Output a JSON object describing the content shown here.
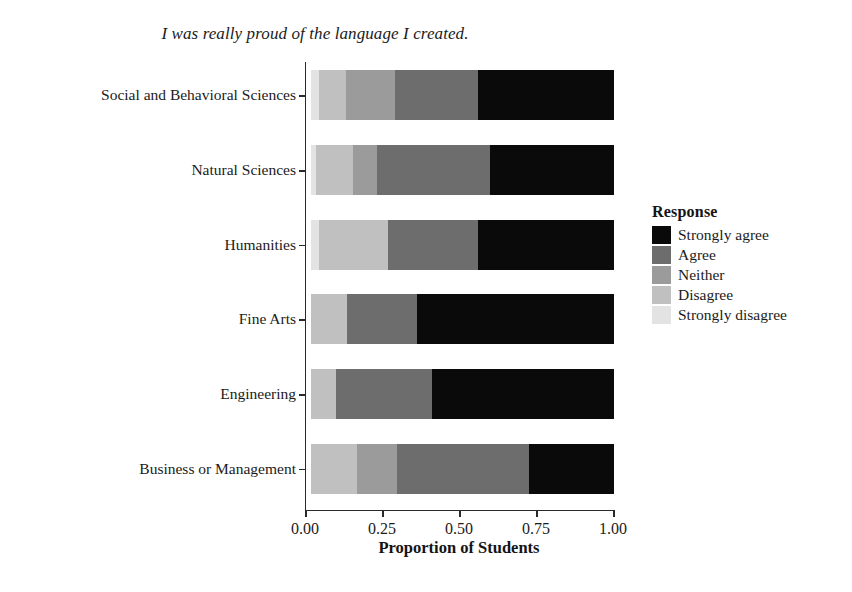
{
  "chart_data": {
    "type": "bar",
    "subtype": "stacked-horizontal-100pct",
    "title": "I was really proud of the language I created.",
    "xlabel": "Proportion of Students",
    "ylabel": "",
    "xlim": [
      0,
      1
    ],
    "xticks": [
      0.0,
      0.25,
      0.5,
      0.75,
      1.0
    ],
    "xticklabels": [
      "0.00",
      "0.25",
      "0.50",
      "0.75",
      "1.00"
    ],
    "grid": false,
    "legend_title": "Response",
    "legend_position": "right",
    "categories": [
      "Social and Behavioral Sciences",
      "Natural Sciences",
      "Humanities",
      "Fine Arts",
      "Engineering",
      "Business or Management"
    ],
    "series": [
      {
        "name": "Strongly disagree",
        "color": "#e3e3e3",
        "values": [
          0.026,
          0.016,
          0.026,
          0.0,
          0.0,
          0.0
        ]
      },
      {
        "name": "Disagree",
        "color": "#c0c0c0",
        "values": [
          0.088,
          0.124,
          0.227,
          0.12,
          0.081,
          0.152
        ]
      },
      {
        "name": "Neither",
        "color": "#9b9b9b",
        "values": [
          0.162,
          0.078,
          0.0,
          0.0,
          0.0,
          0.133
        ]
      },
      {
        "name": "Agree",
        "color": "#6d6d6d",
        "values": [
          0.276,
          0.372,
          0.299,
          0.23,
          0.319,
          0.435
        ]
      },
      {
        "name": "Strongly agree",
        "color": "#0a0a0a",
        "values": [
          0.448,
          0.41,
          0.448,
          0.65,
          0.6,
          0.28
        ]
      }
    ],
    "stack_order": [
      "Strongly disagree",
      "Disagree",
      "Neither",
      "Agree",
      "Strongly agree"
    ],
    "legend_order": [
      "Strongly agree",
      "Agree",
      "Neither",
      "Disagree",
      "Strongly disagree"
    ]
  },
  "legend": {
    "title": "Response",
    "items": [
      {
        "label": "Strongly agree",
        "color": "#0a0a0a"
      },
      {
        "label": "Agree",
        "color": "#6d6d6d"
      },
      {
        "label": "Neither",
        "color": "#9b9b9b"
      },
      {
        "label": "Disagree",
        "color": "#c0c0c0"
      },
      {
        "label": "Strongly disagree",
        "color": "#e3e3e3"
      }
    ]
  },
  "axes": {
    "x_title": "Proportion of Students",
    "x_tick_labels": [
      "0.00",
      "0.25",
      "0.50",
      "0.75",
      "1.00"
    ],
    "y_tick_labels": [
      "Social and Behavioral Sciences",
      "Natural Sciences",
      "Humanities",
      "Fine Arts",
      "Engineering",
      "Business or Management"
    ]
  },
  "title": "I was really proud of the language I created."
}
